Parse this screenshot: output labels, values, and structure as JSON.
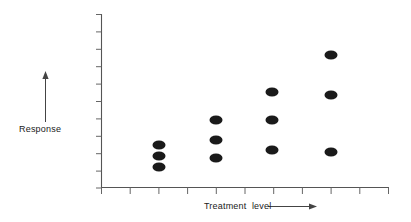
{
  "figure": {
    "background_color": "#ffffff",
    "ink_color": "#1a1a1a",
    "axis_color": "#555555"
  },
  "labels": {
    "response": "Response",
    "treatment": "Treatment  level"
  },
  "annotations": {
    "response_arrow_name": "response-direction-arrow",
    "treatment_arrow_name": "treatment-direction-arrow"
  },
  "chart_data": {
    "type": "scatter",
    "title": "",
    "subtitle": "",
    "xlabel": "Treatment  level",
    "ylabel": "Response",
    "xlim": [
      0,
      10
    ],
    "ylim": [
      0,
      10
    ],
    "grid": false,
    "legend": null,
    "axis_tick_labels": {
      "x": [
        "",
        "",
        "",
        "",
        "",
        "",
        "",
        "",
        "",
        "",
        ""
      ],
      "y": [
        "",
        "",
        "",
        "",
        "",
        "",
        "",
        "",
        "",
        "",
        ""
      ]
    },
    "x_tick_count": 11,
    "y_tick_count": 11,
    "categories": [
      "2",
      "4",
      "6",
      "8"
    ],
    "series": [
      {
        "name": "observations",
        "marker": "filled-ellipse",
        "color": "#1a1a1a",
        "points": [
          {
            "group": 1,
            "x": 2,
            "y": 2.5
          },
          {
            "group": 1,
            "x": 2,
            "y": 1.9
          },
          {
            "group": 1,
            "x": 2,
            "y": 1.2
          },
          {
            "group": 2,
            "x": 4,
            "y": 4.0
          },
          {
            "group": 2,
            "x": 4,
            "y": 2.8
          },
          {
            "group": 2,
            "x": 4,
            "y": 1.8
          },
          {
            "group": 3,
            "x": 6,
            "y": 5.6
          },
          {
            "group": 3,
            "x": 6,
            "y": 4.0
          },
          {
            "group": 3,
            "x": 6,
            "y": 2.3
          },
          {
            "group": 4,
            "x": 8,
            "y": 7.7
          },
          {
            "group": 4,
            "x": 8,
            "y": 5.4
          },
          {
            "group": 4,
            "x": 8,
            "y": 2.2
          }
        ]
      }
    ],
    "pixel_points": [
      {
        "cx": 159,
        "cy": 145
      },
      {
        "cx": 159,
        "cy": 156
      },
      {
        "cx": 159,
        "cy": 167
      },
      {
        "cx": 216,
        "cy": 120
      },
      {
        "cx": 216,
        "cy": 140
      },
      {
        "cx": 216,
        "cy": 158
      },
      {
        "cx": 272,
        "cy": 92
      },
      {
        "cx": 272,
        "cy": 120
      },
      {
        "cx": 272,
        "cy": 150
      },
      {
        "cx": 331,
        "cy": 55
      },
      {
        "cx": 331,
        "cy": 95
      },
      {
        "cx": 331,
        "cy": 152
      }
    ],
    "marker_radius_x": 6.5,
    "marker_radius_y": 4.6
  }
}
